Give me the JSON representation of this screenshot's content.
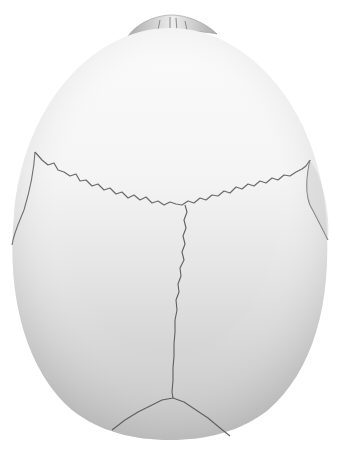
{
  "image": {
    "subject": "Skull, superior view (illustration)",
    "width": 341,
    "height": 451,
    "colors": {
      "background": "#ffffff",
      "bone_light": "#f7f7f7",
      "bone_mid": "#e2e2e2",
      "bone_dark": "#bdbdbd",
      "suture": "#5f5f5f",
      "nasal_region": "#8a8a8a"
    },
    "features": [
      {
        "name": "coronal-suture",
        "label": "Coronal suture"
      },
      {
        "name": "sagittal-suture",
        "label": "Sagittal suture"
      },
      {
        "name": "lambdoid-suture",
        "label": "Lambdoid suture"
      },
      {
        "name": "squamous-suture-left",
        "label": "Temporal border (left)"
      },
      {
        "name": "squamous-suture-right",
        "label": "Temporal border (right)"
      },
      {
        "name": "nasal-bones",
        "label": "Nasal region"
      }
    ]
  }
}
